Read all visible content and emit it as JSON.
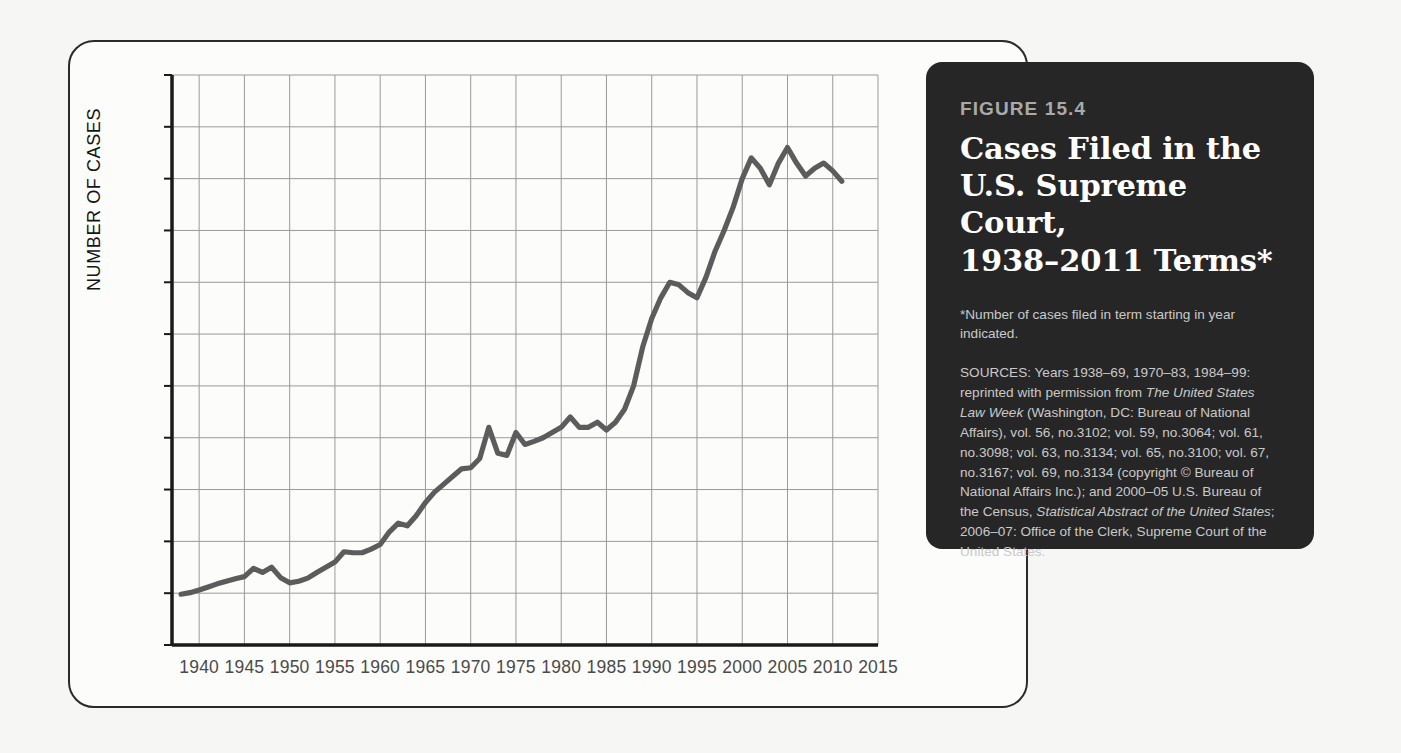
{
  "caption": {
    "figure_number": "FIGURE 15.4",
    "title_lines": [
      "Cases Filed in the",
      "U.S. Supreme Court,",
      "1938–2011 Terms*"
    ],
    "footnote": "*Number of cases filed in term starting in year indicated.",
    "sources_prefix": "SOURCES: Years 1938–69, 1970–83, 1984–99: reprinted with permission from ",
    "sources_italic_1": "The United States Law Week",
    "sources_mid": " (Washington, DC: Bureau of National Affairs), vol. 56, no.3102; vol. 59, no.3064; vol. 61, no.3098; vol. 63, no.3134; vol. 65, no.3100; vol. 67, no.3167; vol. 69, no.3134 (copyright © Bureau of National Affairs Inc.); and 2000–05 U.S. Bureau of the Census, ",
    "sources_italic_2": "Statistical Abstract of the United States",
    "sources_suffix": "; 2006–07: Office of the Clerk, Supreme Court of the United States.",
    "background_color": "#262626",
    "title_color": "#ffffff"
  },
  "chart_data": {
    "type": "line",
    "xlabel": "",
    "ylabel": "NUMBER OF CASES",
    "xlim": [
      1937,
      2015
    ],
    "ylim": [
      0,
      11000
    ],
    "grid": true,
    "legend": null,
    "line_color": "#5c5c5c",
    "grid_color": "#9a9a9a",
    "axis_color": "#1a1a1a",
    "y_ticks": [
      0,
      1000,
      2000,
      3000,
      4000,
      5000,
      6000,
      7000,
      8000,
      9000,
      10000,
      11000
    ],
    "y_tick_labels": [
      "0",
      "1,000",
      "2,000",
      "3,000",
      "4,000",
      "5,000",
      "6,000",
      "7,000",
      "8,000",
      "9,000",
      "10,000",
      "11,000"
    ],
    "x_ticks": [
      1940,
      1945,
      1950,
      1955,
      1960,
      1965,
      1970,
      1975,
      1980,
      1985,
      1990,
      1995,
      2000,
      2005,
      2010,
      2015
    ],
    "x_tick_labels": [
      "1940",
      "1945",
      "1950",
      "1955",
      "1960",
      "1965",
      "1970",
      "1975",
      "1980",
      "1985",
      "1990",
      "1995",
      "2000",
      "2005",
      "2010",
      "2015"
    ],
    "x": [
      1938,
      1939,
      1940,
      1941,
      1942,
      1943,
      1944,
      1945,
      1946,
      1947,
      1948,
      1949,
      1950,
      1951,
      1952,
      1953,
      1954,
      1955,
      1956,
      1957,
      1958,
      1959,
      1960,
      1961,
      1962,
      1963,
      1964,
      1965,
      1966,
      1967,
      1968,
      1969,
      1970,
      1971,
      1972,
      1973,
      1974,
      1975,
      1976,
      1977,
      1978,
      1979,
      1980,
      1981,
      1982,
      1983,
      1984,
      1985,
      1986,
      1987,
      1988,
      1989,
      1990,
      1991,
      1992,
      1993,
      1994,
      1995,
      1996,
      1997,
      1998,
      1999,
      2000,
      2001,
      2002,
      2003,
      2004,
      2005,
      2006,
      2007,
      2008,
      2009,
      2010,
      2011
    ],
    "y": [
      980,
      1010,
      1060,
      1120,
      1180,
      1230,
      1280,
      1320,
      1480,
      1400,
      1500,
      1300,
      1200,
      1230,
      1290,
      1400,
      1500,
      1600,
      1800,
      1780,
      1780,
      1850,
      1940,
      2180,
      2350,
      2300,
      2500,
      2750,
      2950,
      3100,
      3250,
      3400,
      3420,
      3600,
      4200,
      3700,
      3660,
      4100,
      3870,
      3930,
      4000,
      4100,
      4200,
      4400,
      4200,
      4200,
      4300,
      4150,
      4300,
      4550,
      5000,
      5750,
      6300,
      6700,
      7000,
      6950,
      6800,
      6700,
      7100,
      7600,
      8000,
      8450,
      9000,
      9400,
      9200,
      8880,
      9300,
      9600,
      9300,
      9050,
      9200,
      9300,
      9150,
      8950
    ]
  }
}
